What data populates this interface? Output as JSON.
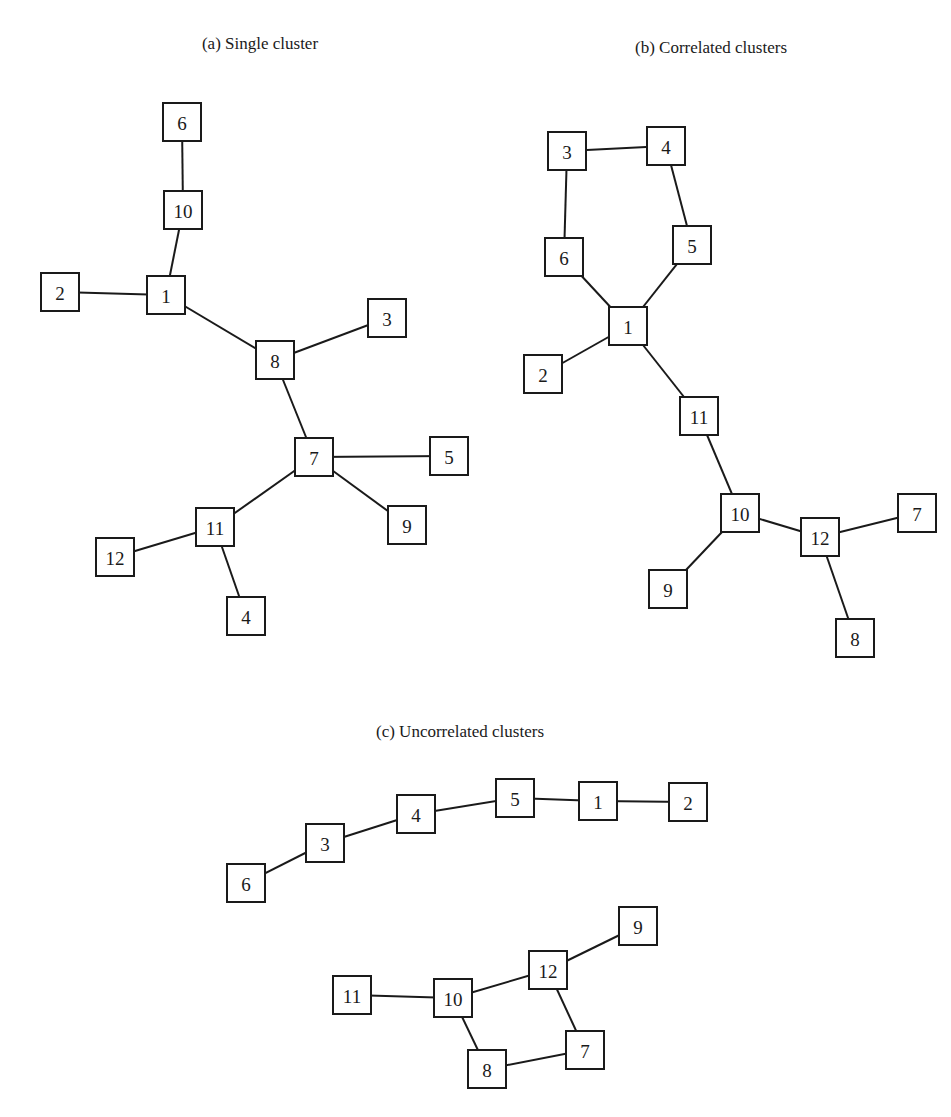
{
  "figure": {
    "width": 951,
    "height": 1117,
    "node_size": 38,
    "stroke_color": "#1a1a1a",
    "background": "#ffffff"
  },
  "panels": [
    {
      "id": "a",
      "title": "(a) Single cluster",
      "title_pos": [
        260,
        45
      ],
      "nodes": [
        {
          "label": "6",
          "x": 182,
          "y": 122
        },
        {
          "label": "10",
          "x": 183,
          "y": 210
        },
        {
          "label": "2",
          "x": 60,
          "y": 292
        },
        {
          "label": "1",
          "x": 166,
          "y": 295
        },
        {
          "label": "3",
          "x": 387,
          "y": 318
        },
        {
          "label": "8",
          "x": 275,
          "y": 360
        },
        {
          "label": "7",
          "x": 314,
          "y": 457
        },
        {
          "label": "5",
          "x": 449,
          "y": 456
        },
        {
          "label": "9",
          "x": 407,
          "y": 525
        },
        {
          "label": "11",
          "x": 215,
          "y": 527
        },
        {
          "label": "12",
          "x": 115,
          "y": 557
        },
        {
          "label": "4",
          "x": 246,
          "y": 616
        }
      ],
      "edges": [
        [
          "6",
          "10"
        ],
        [
          "10",
          "1"
        ],
        [
          "2",
          "1"
        ],
        [
          "1",
          "8"
        ],
        [
          "8",
          "3"
        ],
        [
          "8",
          "7"
        ],
        [
          "7",
          "5"
        ],
        [
          "7",
          "9"
        ],
        [
          "7",
          "11"
        ],
        [
          "11",
          "12"
        ],
        [
          "11",
          "4"
        ]
      ]
    },
    {
      "id": "b",
      "title": "(b) Correlated clusters",
      "title_pos": [
        711,
        49
      ],
      "nodes": [
        {
          "label": "3",
          "x": 567,
          "y": 151
        },
        {
          "label": "4",
          "x": 666,
          "y": 146
        },
        {
          "label": "6",
          "x": 564,
          "y": 257
        },
        {
          "label": "5",
          "x": 692,
          "y": 245
        },
        {
          "label": "1",
          "x": 628,
          "y": 326
        },
        {
          "label": "2",
          "x": 543,
          "y": 374
        },
        {
          "label": "11",
          "x": 699,
          "y": 416
        },
        {
          "label": "10",
          "x": 740,
          "y": 513
        },
        {
          "label": "12",
          "x": 820,
          "y": 537
        },
        {
          "label": "7",
          "x": 917,
          "y": 513
        },
        {
          "label": "9",
          "x": 668,
          "y": 589
        },
        {
          "label": "8",
          "x": 855,
          "y": 638
        }
      ],
      "edges": [
        [
          "3",
          "4"
        ],
        [
          "3",
          "6"
        ],
        [
          "4",
          "5"
        ],
        [
          "6",
          "1"
        ],
        [
          "5",
          "1"
        ],
        [
          "1",
          "2"
        ],
        [
          "1",
          "11"
        ],
        [
          "11",
          "10"
        ],
        [
          "10",
          "12"
        ],
        [
          "10",
          "9"
        ],
        [
          "12",
          "7"
        ],
        [
          "12",
          "8"
        ]
      ]
    },
    {
      "id": "c",
      "title": "(c) Uncorrelated clusters",
      "title_pos": [
        460,
        733
      ],
      "nodes": [
        {
          "label": "5",
          "x": 515,
          "y": 798
        },
        {
          "label": "1",
          "x": 598,
          "y": 801
        },
        {
          "label": "2",
          "x": 688,
          "y": 802
        },
        {
          "label": "4",
          "x": 416,
          "y": 814
        },
        {
          "label": "3",
          "x": 325,
          "y": 843
        },
        {
          "label": "6",
          "x": 246,
          "y": 883
        },
        {
          "label": "9",
          "x": 638,
          "y": 926
        },
        {
          "label": "12",
          "x": 548,
          "y": 970
        },
        {
          "label": "11",
          "x": 352,
          "y": 995
        },
        {
          "label": "10",
          "x": 453,
          "y": 998
        },
        {
          "label": "7",
          "x": 585,
          "y": 1050
        },
        {
          "label": "8",
          "x": 487,
          "y": 1069
        }
      ],
      "edges": [
        [
          "6",
          "3"
        ],
        [
          "3",
          "4"
        ],
        [
          "4",
          "5"
        ],
        [
          "5",
          "1"
        ],
        [
          "1",
          "2"
        ],
        [
          "11",
          "10"
        ],
        [
          "10",
          "12"
        ],
        [
          "12",
          "9"
        ],
        [
          "12",
          "7"
        ],
        [
          "10",
          "8"
        ],
        [
          "8",
          "7"
        ]
      ]
    }
  ]
}
